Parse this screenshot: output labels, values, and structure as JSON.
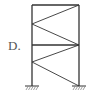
{
  "option_label": "D.",
  "diagram": {
    "stroke_color": "#333333",
    "hatch_color": "#666666"
  }
}
